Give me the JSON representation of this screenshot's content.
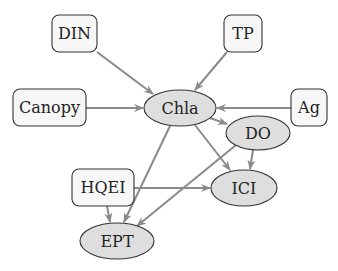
{
  "diagram": {
    "type": "directed-graph",
    "colors": {
      "edge": "#8a8a8a",
      "box_fill": "#f7f7f7",
      "ellipse_fill": "#dedede",
      "stroke": "#333333"
    },
    "nodes": {
      "din": {
        "label": "DIN",
        "shape": "rounded-box"
      },
      "tp": {
        "label": "TP",
        "shape": "rounded-box"
      },
      "canopy": {
        "label": "Canopy",
        "shape": "rounded-box"
      },
      "ag": {
        "label": "Ag",
        "shape": "rounded-box"
      },
      "chla": {
        "label": "Chla",
        "shape": "ellipse"
      },
      "do": {
        "label": "DO",
        "shape": "ellipse"
      },
      "ici": {
        "label": "ICI",
        "shape": "ellipse"
      },
      "hqei": {
        "label": "HQEI",
        "shape": "rounded-box"
      },
      "ept": {
        "label": "EPT",
        "shape": "ellipse"
      }
    },
    "edges": [
      {
        "from": "DIN",
        "to": "Chla"
      },
      {
        "from": "TP",
        "to": "Chla"
      },
      {
        "from": "Canopy",
        "to": "Chla"
      },
      {
        "from": "Ag",
        "to": "Chla"
      },
      {
        "from": "Chla",
        "to": "DO"
      },
      {
        "from": "Chla",
        "to": "ICI"
      },
      {
        "from": "Chla",
        "to": "EPT"
      },
      {
        "from": "DO",
        "to": "ICI"
      },
      {
        "from": "DO",
        "to": "EPT"
      },
      {
        "from": "HQEI",
        "to": "ICI"
      },
      {
        "from": "HQEI",
        "to": "EPT"
      }
    ]
  }
}
